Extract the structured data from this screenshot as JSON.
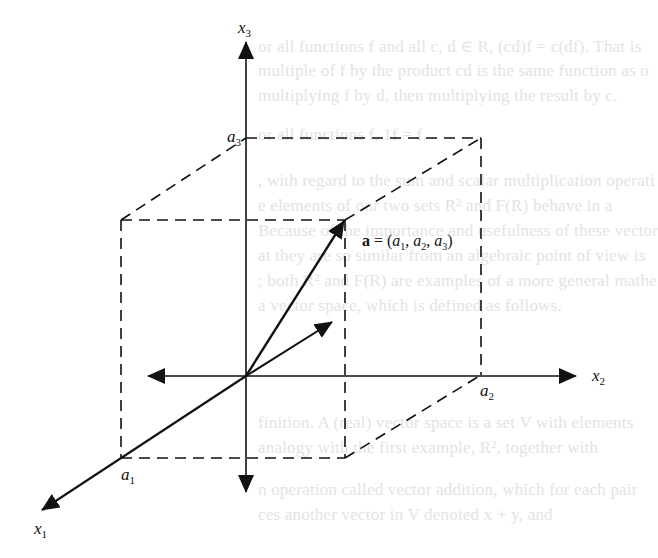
{
  "figure": {
    "type": "3d-coordinate-system",
    "axes": {
      "x1": {
        "label": "x",
        "subscript": "1",
        "tick_label": "a",
        "tick_subscript": "1"
      },
      "x2": {
        "label": "x",
        "subscript": "2",
        "tick_label": "a",
        "tick_subscript": "2"
      },
      "x3": {
        "label": "x",
        "subscript": "3",
        "tick_label": "a",
        "tick_subscript": "3"
      }
    },
    "vector": {
      "name": "a",
      "equals": " = (",
      "components": [
        {
          "base": "a",
          "sub": "1"
        },
        {
          "base": "a",
          "sub": "2"
        },
        {
          "base": "a",
          "sub": "3"
        }
      ],
      "sep": ", ",
      "close": ")"
    },
    "colors": {
      "ink": "#111111",
      "background": "#ffffff",
      "bleed_through": "#e3e3e3"
    }
  },
  "bleed_through_text": [
    "or all functions f and all c, d ∈ R, (cd)f = c(df). That is",
    "multiple of f by the product cd is the same function as o",
    "multiplying f by d, then multiplying the result by c.",
    "or all functions f, 1f = f.",
    ", with regard to the sum and scalar multiplication operati",
    "e elements of our two sets R² and F(R) behave in a",
    "Because of the importance and usefulness of these vector",
    "at they are so similar from an algebraic point of view is",
    "; both R² and F(R) are examples of a more general mathe",
    "a vector space, which is defined as follows.",
    "finition.  A (real) vector space is a set V with elements",
    "analogy with the first example, R², together with",
    "n operation called vector addition, which for each pair",
    "ces another vector in V denoted x + y, and"
  ]
}
